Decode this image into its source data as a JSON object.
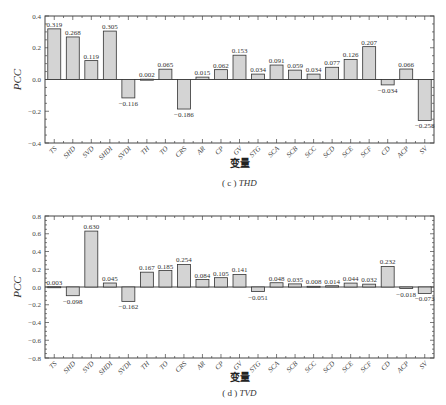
{
  "chart_data": [
    {
      "type": "bar",
      "panel": "(c)",
      "caption_prefix": "( c )",
      "caption_var": "THD",
      "title": "",
      "xlabel": "变量",
      "ylabel": "PCC",
      "ylim": [
        -0.4,
        0.4
      ],
      "yticks": [
        0.4,
        0.2,
        0.0,
        -0.2,
        -0.4
      ],
      "ytick_labels": [
        "0.4",
        "0.2",
        "0.0",
        "-0.2",
        "-0.4"
      ],
      "grid": false,
      "categories": [
        "TS",
        "SHD",
        "SVD",
        "SHDI",
        "SVDI",
        "TH",
        "TO",
        "CRS",
        "AR",
        "CP",
        "GV",
        "STG",
        "SCA",
        "SCB",
        "SCC",
        "SCD",
        "SCE",
        "SCF",
        "CD",
        "ACP",
        "SV"
      ],
      "values": [
        0.319,
        0.268,
        0.119,
        0.305,
        -0.116,
        0.002,
        0.065,
        -0.186,
        0.015,
        0.062,
        0.153,
        0.034,
        0.091,
        0.059,
        0.034,
        0.077,
        0.126,
        0.207,
        -0.034,
        0.066,
        -0.258
      ],
      "value_labels": [
        "0.319",
        "0.268",
        "0.119",
        "0.305",
        "-0.116",
        "0.002",
        "0.065",
        "-0.186",
        "0.015",
        "0.062",
        "0.153",
        "0.034",
        "0.091",
        "0.059",
        "0.034",
        "0.077",
        "0.126",
        "0.207",
        "-0.034",
        "0.066",
        "-0.258"
      ]
    },
    {
      "type": "bar",
      "panel": "(d)",
      "caption_prefix": "( d )",
      "caption_var": "TVD",
      "title": "",
      "xlabel": "变量",
      "ylabel": "PCC",
      "ylim": [
        -0.8,
        0.8
      ],
      "yticks": [
        0.8,
        0.6,
        0.4,
        0.2,
        0.0,
        -0.2,
        -0.4,
        -0.6,
        -0.8
      ],
      "ytick_labels": [
        "0.8",
        "0.6",
        "0.4",
        "0.2",
        "0.0",
        "-0.2",
        "-0.4",
        "-0.6",
        "-0.8"
      ],
      "grid": false,
      "categories": [
        "TS",
        "SHD",
        "SVD",
        "SHDI",
        "SVDI",
        "TH",
        "TO",
        "CRS",
        "AR",
        "CP",
        "GV",
        "STG",
        "SCA",
        "SCB",
        "SCC",
        "SCD",
        "SCE",
        "SCF",
        "CD",
        "ACP",
        "SV"
      ],
      "values": [
        0.003,
        -0.098,
        0.63,
        0.045,
        -0.162,
        0.167,
        0.185,
        0.254,
        0.084,
        0.105,
        0.141,
        -0.051,
        0.048,
        0.035,
        0.008,
        0.014,
        0.044,
        0.032,
        0.232,
        -0.018,
        -0.073
      ],
      "value_labels": [
        "0.003",
        "-0.098",
        "0.630",
        "0.045",
        "-0.162",
        "0.167",
        "0.185",
        "0.254",
        "0.084",
        "0.105",
        "0.141",
        "-0.051",
        "0.048",
        "0.035",
        "0.008",
        "0.014",
        "0.044",
        "0.032",
        "0.232",
        "-0.018",
        "-0.073"
      ]
    }
  ],
  "layout": {
    "panels": [
      {
        "left": 45,
        "right": 434,
        "top": 16,
        "bottom": 143,
        "xlabel_y": 167,
        "caption_y": 186
      },
      {
        "left": 45,
        "right": 434,
        "top": 216,
        "bottom": 358,
        "xlabel_y": 381,
        "caption_y": 396
      }
    ],
    "bar_color": "#d4d4d4",
    "bar_stroke": "#333333"
  }
}
